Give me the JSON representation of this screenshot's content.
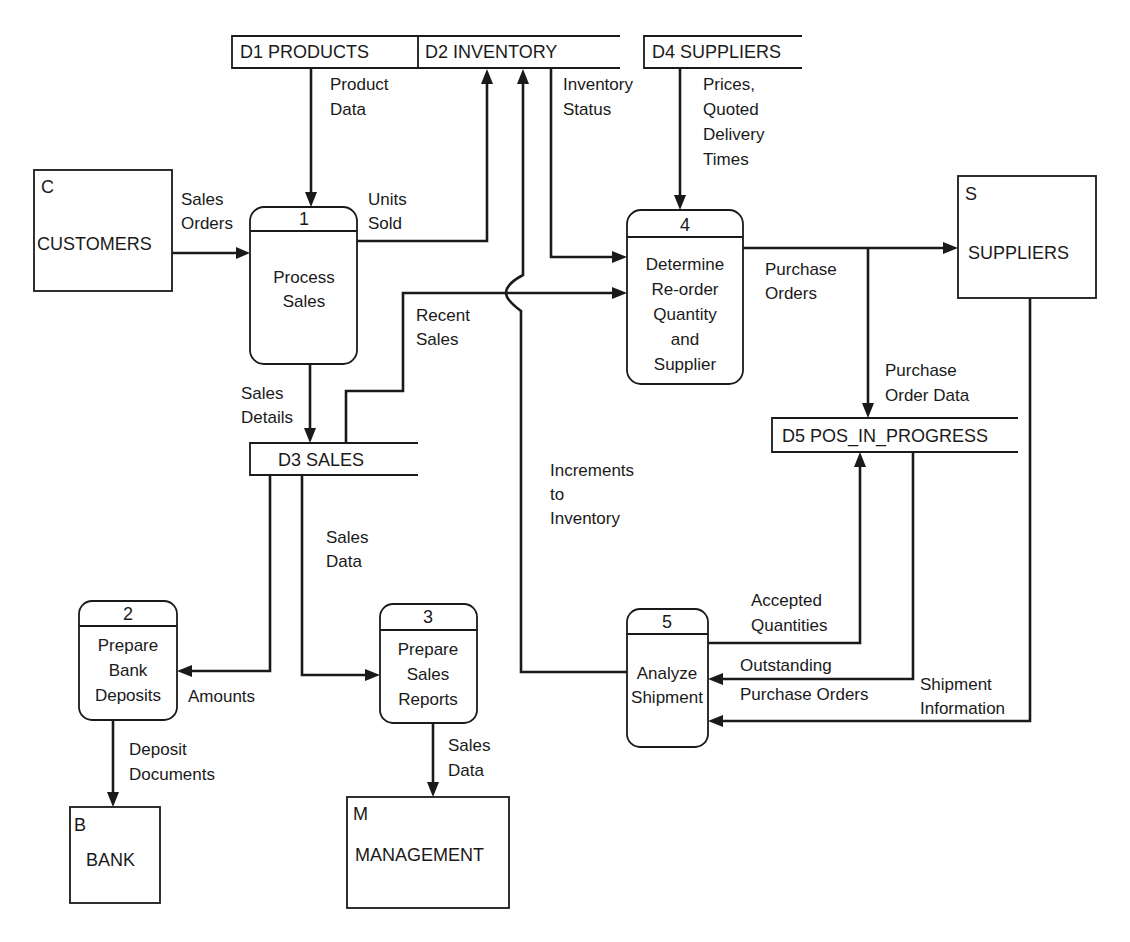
{
  "diagram": {
    "type": "data-flow-diagram",
    "external_entities": [
      {
        "id": "C",
        "code": "C",
        "name": "CUSTOMERS"
      },
      {
        "id": "S",
        "code": "S",
        "name": "SUPPLIERS"
      },
      {
        "id": "B",
        "code": "B",
        "name": "BANK"
      },
      {
        "id": "M",
        "code": "M",
        "name": "MANAGEMENT"
      }
    ],
    "processes": [
      {
        "number": "1",
        "lines": [
          "Process",
          "Sales"
        ]
      },
      {
        "number": "2",
        "lines": [
          "Prepare",
          "Bank",
          "Deposits"
        ]
      },
      {
        "number": "3",
        "lines": [
          "Prepare",
          "Sales",
          "Reports"
        ]
      },
      {
        "number": "4",
        "lines": [
          "Determine",
          "Re-order",
          "Quantity",
          "and",
          "Supplier"
        ]
      },
      {
        "number": "5",
        "lines": [
          "Analyze",
          "Shipment"
        ]
      }
    ],
    "data_stores": [
      {
        "id": "D1",
        "label": "D1 PRODUCTS"
      },
      {
        "id": "D2",
        "label": "D2 INVENTORY"
      },
      {
        "id": "D3",
        "label": "D3 SALES"
      },
      {
        "id": "D4",
        "label": "D4 SUPPLIERS"
      },
      {
        "id": "D5",
        "label": "D5 POS_IN_PROGRESS"
      }
    ],
    "flows": {
      "product_data": [
        "Product",
        "Data"
      ],
      "inventory_status": [
        "Inventory",
        "Status"
      ],
      "prices": [
        "Prices,",
        "Quoted",
        "Delivery",
        "Times"
      ],
      "sales_orders": [
        "Sales",
        "Orders"
      ],
      "units_sold": [
        "Units",
        "Sold"
      ],
      "recent_sales": [
        "Recent",
        "Sales"
      ],
      "purchase_orders": [
        "Purchase",
        "Orders"
      ],
      "purchase_order_data": [
        "Purchase",
        "Order Data"
      ],
      "sales_details": [
        "Sales",
        "Details"
      ],
      "increments": [
        "Increments",
        "to",
        "Inventory"
      ],
      "sales_data_store": [
        "Sales",
        "Data"
      ],
      "accepted_quantities": [
        "Accepted",
        "Quantities"
      ],
      "outstanding": [
        "Outstanding",
        "Purchase Orders"
      ],
      "shipment_information": [
        "Shipment",
        "Information"
      ],
      "amounts": [
        "Amounts"
      ],
      "deposit_documents": [
        "Deposit",
        "Documents"
      ],
      "sales_data_report": [
        "Sales",
        "Data"
      ]
    }
  }
}
